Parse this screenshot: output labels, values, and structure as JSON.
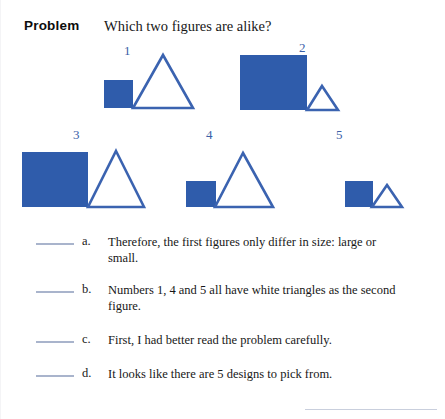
{
  "header": {
    "label": "Problem",
    "question": "Which two figures are alike?"
  },
  "colors": {
    "shape_blue": "#2f5cab",
    "outline_blue": "#3b63b0",
    "number_blue": "#3b5fa8",
    "blank_line": "#a9b4cc",
    "text": "#171717"
  },
  "figures": [
    {
      "number": "1",
      "square": {
        "size": "small",
        "fill": "solid-blue"
      },
      "triangle": {
        "size": "large",
        "fill": "white"
      }
    },
    {
      "number": "2",
      "square": {
        "size": "large",
        "fill": "solid-blue"
      },
      "triangle": {
        "size": "small",
        "fill": "white"
      }
    },
    {
      "number": "3",
      "square": {
        "size": "large",
        "fill": "solid-blue"
      },
      "triangle": {
        "size": "large",
        "fill": "white"
      }
    },
    {
      "number": "4",
      "square": {
        "size": "small",
        "fill": "solid-blue"
      },
      "triangle": {
        "size": "large",
        "fill": "white"
      }
    },
    {
      "number": "5",
      "square": {
        "size": "small",
        "fill": "solid-blue"
      },
      "triangle": {
        "size": "small",
        "fill": "white"
      }
    }
  ],
  "answers": [
    {
      "letter": "a.",
      "text": "Therefore, the first figures only differ in size: large or small.",
      "blank": ""
    },
    {
      "letter": "b.",
      "text": "Numbers 1, 4 and 5 all have white triangles as the second figure.",
      "blank": ""
    },
    {
      "letter": "c.",
      "text": "First, I had better read the problem carefully.",
      "blank": ""
    },
    {
      "letter": "d.",
      "text": "It looks like there are 5 designs to pick from.",
      "blank": ""
    }
  ]
}
